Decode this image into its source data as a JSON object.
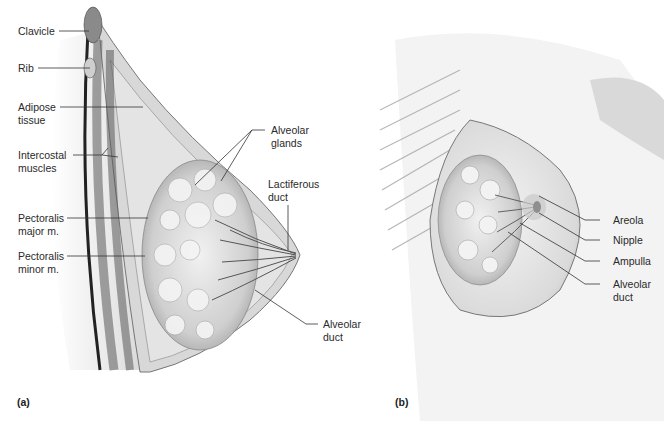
{
  "figure": {
    "panels": [
      {
        "id": "a",
        "tag": "(a)",
        "view": "sagittal section",
        "labels": {
          "clavicle": "Clavicle",
          "rib": "Rib",
          "adipose": "Adipose\ntissue",
          "intercostal": "Intercostal\nmuscles",
          "pect_major": "Pectoralis\nmajor m.",
          "pect_minor": "Pectoralis\nminor m.",
          "alveolar_glands": "Alveolar\nglands",
          "lactiferous": "Lactiferous\nduct",
          "alveolar_duct": "Alveolar\nduct"
        }
      },
      {
        "id": "b",
        "tag": "(b)",
        "view": "anterior view",
        "labels": {
          "areola": "Areola",
          "nipple": "Nipple",
          "ampulla": "Ampulla",
          "alveolar_duct": "Alveolar\nduct"
        }
      }
    ],
    "colors": {
      "ink": "#2a2a2a",
      "tissue_light": "#e6e6e6",
      "tissue_mid": "#bdbdbd",
      "tissue_dark": "#6e6e6e",
      "leader": "#333333"
    }
  }
}
